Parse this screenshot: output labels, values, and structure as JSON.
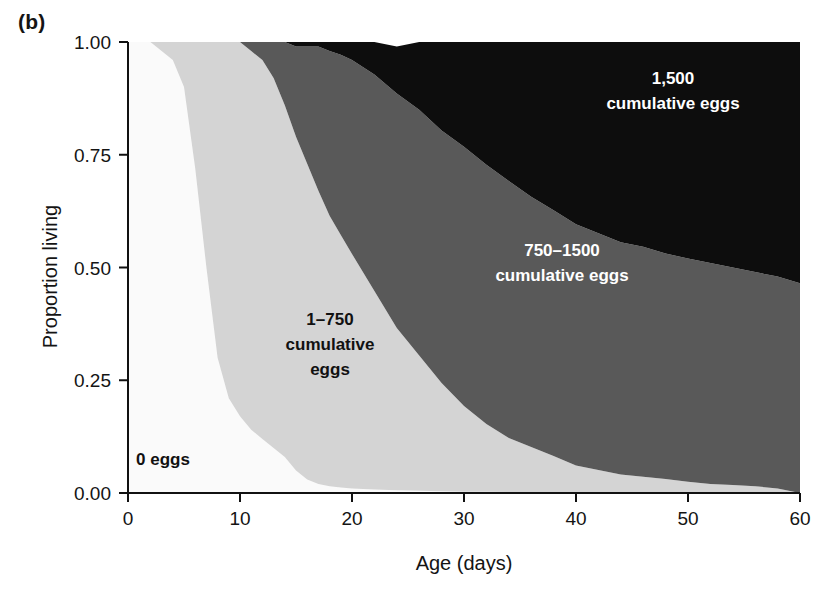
{
  "panel": {
    "letter": "(b)"
  },
  "axes": {
    "x_title": "Age (days)",
    "y_title": "Proportion living",
    "x_ticks": [
      "0",
      "10",
      "20",
      "30",
      "40",
      "50",
      "60"
    ],
    "y_ticks": [
      "0.00",
      "0.25",
      "0.50",
      "0.75",
      "1.00"
    ]
  },
  "band_labels": {
    "zero": "0 eggs",
    "low_l1": "1–750",
    "low_l2": "cumulative",
    "low_l3": "eggs",
    "mid_l1": "750–1500",
    "mid_l2": "cumulative eggs",
    "high_l1": "1,500",
    "high_l2": "cumulative eggs"
  },
  "colors": {
    "zero_eggs": "#fafafa",
    "low_eggs": "#d4d4d4",
    "mid_eggs": "#595959",
    "high_eggs": "#0d0d0d",
    "axis": "#111111",
    "background": "#ffffff"
  },
  "chart_data": {
    "type": "area",
    "stacking": "normal",
    "title": "",
    "xlabel": "Age (days)",
    "ylabel": "Proportion living",
    "xlim": [
      0,
      60
    ],
    "ylim": [
      0,
      1
    ],
    "xticks": [
      0,
      10,
      20,
      30,
      40,
      50,
      60
    ],
    "yticks": [
      0,
      0.25,
      0.5,
      0.75,
      1
    ],
    "grid": false,
    "legend": "in-plot annotations",
    "x": [
      0,
      2,
      4,
      5,
      6,
      7,
      8,
      9,
      10,
      11,
      12,
      13,
      14,
      15,
      16,
      17,
      18,
      19,
      20,
      22,
      24,
      26,
      28,
      30,
      32,
      34,
      36,
      38,
      40,
      42,
      44,
      46,
      48,
      50,
      52,
      54,
      56,
      58,
      60
    ],
    "series": [
      {
        "name": "0 eggs",
        "label": "0 eggs",
        "color": "#fafafa",
        "values": [
          1.0,
          1.0,
          0.96,
          0.9,
          0.72,
          0.5,
          0.3,
          0.21,
          0.17,
          0.14,
          0.12,
          0.1,
          0.08,
          0.05,
          0.03,
          0.02,
          0.015,
          0.012,
          0.01,
          0.008,
          0.006,
          0.005,
          0.004,
          0.003,
          0.003,
          0.002,
          0.002,
          0.002,
          0.001,
          0.001,
          0.001,
          0.001,
          0.001,
          0.0,
          0.0,
          0.0,
          0.0,
          0.0,
          0.0
        ]
      },
      {
        "name": "1-750 cumulative eggs",
        "label": "1–750 cumulative eggs",
        "color": "#d4d4d4",
        "values": [
          0.0,
          0.0,
          0.04,
          0.1,
          0.28,
          0.5,
          0.7,
          0.79,
          0.83,
          0.84,
          0.84,
          0.82,
          0.78,
          0.74,
          0.7,
          0.65,
          0.6,
          0.56,
          0.52,
          0.44,
          0.36,
          0.3,
          0.24,
          0.19,
          0.15,
          0.12,
          0.1,
          0.08,
          0.06,
          0.05,
          0.04,
          0.035,
          0.03,
          0.025,
          0.02,
          0.018,
          0.015,
          0.01,
          0.0
        ]
      },
      {
        "name": "750-1500 cumulative eggs",
        "label": "750–1500 cumulative eggs",
        "color": "#595959",
        "values": [
          0.0,
          0.0,
          0.0,
          0.0,
          0.0,
          0.0,
          0.0,
          0.0,
          0.0,
          0.02,
          0.04,
          0.08,
          0.14,
          0.2,
          0.26,
          0.32,
          0.365,
          0.4,
          0.43,
          0.48,
          0.52,
          0.545,
          0.56,
          0.575,
          0.575,
          0.57,
          0.555,
          0.545,
          0.535,
          0.525,
          0.515,
          0.51,
          0.5,
          0.495,
          0.49,
          0.482,
          0.475,
          0.47,
          0.465
        ]
      },
      {
        "name": "1,500 cumulative eggs",
        "label": "1,500 cumulative eggs",
        "color": "#0d0d0d",
        "values": [
          0.0,
          0.0,
          0.0,
          0.0,
          0.0,
          0.0,
          0.0,
          0.0,
          0.0,
          0.0,
          0.0,
          0.0,
          0.0,
          0.01,
          0.01,
          0.01,
          0.02,
          0.028,
          0.04,
          0.072,
          0.104,
          0.15,
          0.196,
          0.232,
          0.272,
          0.308,
          0.343,
          0.373,
          0.404,
          0.424,
          0.444,
          0.454,
          0.469,
          0.48,
          0.49,
          0.5,
          0.51,
          0.52,
          0.535
        ]
      }
    ],
    "cumulative_upper_boundaries": {
      "zero_eggs_top": [
        1.0,
        1.0,
        0.96,
        0.9,
        0.72,
        0.5,
        0.3,
        0.21,
        0.17,
        0.14,
        0.12,
        0.1,
        0.08,
        0.05,
        0.03,
        0.02,
        0.015,
        0.012,
        0.01,
        0.008,
        0.006,
        0.005,
        0.004,
        0.003,
        0.003,
        0.002,
        0.002,
        0.002,
        0.001,
        0.001,
        0.001,
        0.001,
        0.001,
        0.0,
        0.0,
        0.0,
        0.0,
        0.0,
        0.0
      ],
      "low_eggs_top": [
        1.0,
        1.0,
        1.0,
        1.0,
        1.0,
        1.0,
        1.0,
        1.0,
        1.0,
        0.98,
        0.96,
        0.92,
        0.86,
        0.79,
        0.73,
        0.67,
        0.615,
        0.572,
        0.53,
        0.448,
        0.366,
        0.305,
        0.244,
        0.193,
        0.153,
        0.122,
        0.102,
        0.082,
        0.061,
        0.051,
        0.041,
        0.036,
        0.031,
        0.025,
        0.02,
        0.018,
        0.015,
        0.01,
        0.0
      ],
      "mid_eggs_top": [
        1.0,
        1.0,
        1.0,
        1.0,
        1.0,
        1.0,
        1.0,
        1.0,
        1.0,
        1.0,
        1.0,
        1.0,
        1.0,
        0.99,
        0.99,
        0.99,
        0.98,
        0.972,
        0.96,
        0.928,
        0.886,
        0.85,
        0.804,
        0.768,
        0.728,
        0.692,
        0.657,
        0.627,
        0.596,
        0.576,
        0.556,
        0.546,
        0.531,
        0.52,
        0.51,
        0.5,
        0.49,
        0.48,
        0.465
      ]
    }
  }
}
